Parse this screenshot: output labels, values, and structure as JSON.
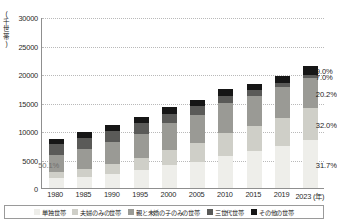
{
  "chart_data": {
    "type": "bar",
    "stacked": true,
    "title": "",
    "xlabel": "年",
    "ylabel": "(千世帯)",
    "y_unit_chars": [
      "(",
      "千",
      "世",
      "帯",
      ")"
    ],
    "categories": [
      "1980",
      "1985",
      "1990",
      "1995",
      "2000",
      "2005",
      "2010",
      "2015",
      "2019",
      "2023"
    ],
    "x_axis_suffix": "(年)",
    "ylim": [
      0,
      30000
    ],
    "yticks": [
      0,
      5000,
      10000,
      15000,
      20000,
      25000,
      30000
    ],
    "ytick_labels": [
      "0",
      "5000",
      "10000",
      "15000",
      "20000",
      "25000",
      "30000"
    ],
    "grid": true,
    "legend_position": "bottom",
    "series": [
      {
        "name": "単独世帯",
        "color": "#eeeeea",
        "values": [
          1690,
          2010,
          2490,
          3080,
          3980,
          4630,
          5670,
          6480,
          7340,
          8490
        ]
      },
      {
        "name": "夫婦のみの世帯",
        "color": "#cfcfc8",
        "values": [
          1070,
          1380,
          1700,
          2130,
          2710,
          3230,
          3930,
          4380,
          4970,
          5490
        ]
      },
      {
        "name": "親と未婚の子のみの世帯",
        "color": "#9a9a95",
        "values": [
          3070,
          3470,
          3840,
          4220,
          4670,
          5000,
          5270,
          5350,
          5430,
          5400
        ]
      },
      {
        "name": "三世代世帯",
        "color": "#5a5a58",
        "values": [
          1900,
          1980,
          2020,
          1900,
          1690,
          1450,
          1220,
          910,
          680,
          470
        ]
      },
      {
        "name": "その他の世帯",
        "color": "#161616",
        "values": [
          810,
          920,
          1020,
          1100,
          1140,
          1190,
          1200,
          1220,
          1290,
          1580
        ]
      }
    ],
    "annotations": [
      {
        "text": "50.1%",
        "series": "親と未婚の子のみの世帯",
        "category": "1980",
        "style": "light"
      },
      {
        "text": "31.7%",
        "series": "単独世帯",
        "category": "2023",
        "style": "onwhite"
      },
      {
        "text": "32.0%",
        "series": "夫婦のみの世帯",
        "category": "2023",
        "style": "onwhite"
      },
      {
        "text": "20.2%",
        "series": "親と未婚の子のみの世帯",
        "category": "2023",
        "style": "onwhite"
      },
      {
        "text": "7.0%",
        "series": "三世代世帯",
        "category": "2023",
        "style": "onwhite"
      },
      {
        "text": "9.0%",
        "series": "その他の世帯",
        "category": "2023",
        "style": "onwhite"
      }
    ]
  }
}
